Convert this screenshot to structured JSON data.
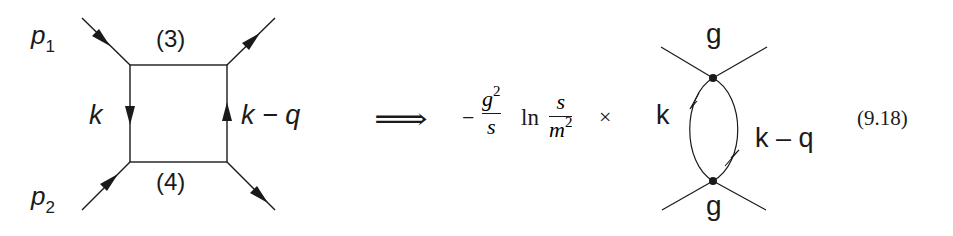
{
  "diagram": {
    "box_diagram": {
      "external_labels": [
        {
          "id": "p1",
          "base": "p",
          "subscript": "1"
        },
        {
          "id": "p2",
          "base": "p",
          "subscript": "2"
        }
      ],
      "propagator_labels": {
        "top": "(3)",
        "bottom": "(4)",
        "left": "k",
        "right": "k − q"
      }
    },
    "implies_arrow": "⟹",
    "formula": {
      "minus": "−",
      "frac1": {
        "num_base": "g",
        "num_exp": "2",
        "den": "s"
      },
      "ln": "ln",
      "frac2": {
        "num": "s",
        "den_base": "m",
        "den_exp": "2"
      },
      "times": "×"
    },
    "bubble_diagram": {
      "top_vertex_label": "g",
      "bottom_vertex_label": "g",
      "left_label": "k",
      "right_label": "k – q"
    },
    "equation_number": "(9.18)",
    "colors": {
      "ink": "#1a1a1a",
      "background": "#ffffff"
    }
  }
}
